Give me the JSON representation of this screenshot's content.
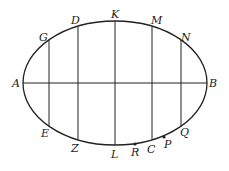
{
  "diagram": {
    "ellipse": {
      "cx": 115,
      "cy": 83,
      "rx": 92,
      "ry": 62
    },
    "axis": {
      "from": "A",
      "to": "B"
    },
    "chords": [
      {
        "top": "G",
        "bottom": "E",
        "x": 49
      },
      {
        "top": "D",
        "bottom": "Z",
        "x": 78
      },
      {
        "top": "K",
        "bottom": "L",
        "x": 115
      },
      {
        "top": "M",
        "bottom": "C",
        "x": 152
      },
      {
        "top": "N",
        "bottom": "Q",
        "x": 181
      }
    ],
    "points": [
      {
        "name": "R",
        "x": 135,
        "y": 144
      },
      {
        "name": "P",
        "x": 164,
        "y": 137
      }
    ],
    "labels": {
      "A": "A",
      "B": "B",
      "G": "G",
      "D": "D",
      "K": "K",
      "M": "M",
      "N": "N",
      "E": "E",
      "Z": "Z",
      "L": "L",
      "R": "R",
      "C": "C",
      "P": "P",
      "Q": "Q"
    },
    "colors": {
      "stroke": "#222222",
      "background": "#ffffff"
    }
  }
}
